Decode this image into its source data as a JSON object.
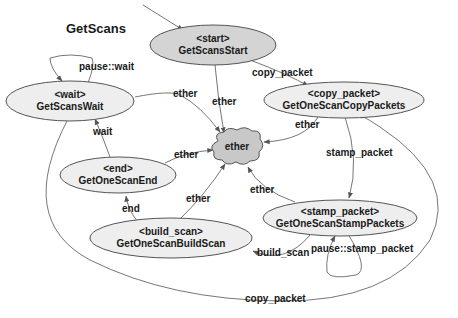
{
  "title": "GetScans",
  "colors": {
    "node_fill": "#eeeeee",
    "start_fill": "#d4d4d4",
    "ether_fill": "#c8c8c8",
    "stroke": "#555555"
  },
  "nodes": [
    {
      "id": "start",
      "stereotype": "<start>",
      "name": "GetScansStart"
    },
    {
      "id": "wait",
      "stereotype": "<wait>",
      "name": "GetScansWait"
    },
    {
      "id": "copy_packet",
      "stereotype": "<copy_packet>",
      "name": "GetOneScanCopyPackets"
    },
    {
      "id": "end",
      "stereotype": "<end>",
      "name": "GetOneScanEnd"
    },
    {
      "id": "stamp_packet",
      "stereotype": "<stamp_packet>",
      "name": "GetOneScanStampPackets"
    },
    {
      "id": "build_scan",
      "stereotype": "<build_scan>",
      "name": "GetOneScanBuildScan"
    },
    {
      "id": "ether",
      "name": "ether"
    }
  ],
  "edges": [
    {
      "label": "copy_packet",
      "from": "GetScansStart",
      "to": "GetOneScanCopyPackets"
    },
    {
      "label": "ether",
      "from": "GetScansStart",
      "to": "ether"
    },
    {
      "label": "pause::wait",
      "from": "GetScansWait",
      "to": "GetScansWait"
    },
    {
      "label": "ether",
      "from": "GetScansWait",
      "to": "ether"
    },
    {
      "label": "ether",
      "from": "GetOneScanCopyPackets",
      "to": "ether"
    },
    {
      "label": "stamp_packet",
      "from": "GetOneScanCopyPackets",
      "to": "GetOneScanStampPackets"
    },
    {
      "label": "wait",
      "from": "GetOneScanEnd",
      "to": "GetScansWait"
    },
    {
      "label": "ether",
      "from": "GetOneScanEnd",
      "to": "ether"
    },
    {
      "label": "ether",
      "from": "GetOneScanStampPackets",
      "to": "ether"
    },
    {
      "label": "end",
      "from": "GetOneScanBuildScan",
      "to": "GetOneScanEnd"
    },
    {
      "label": "ether",
      "from": "GetOneScanBuildScan",
      "to": "ether"
    },
    {
      "label": "build_scan",
      "from": "GetOneScanStampPackets",
      "to": "GetOneScanBuildScan"
    },
    {
      "label": "pause::stamp_packet",
      "from": "GetOneScanStampPackets",
      "to": "GetOneScanStampPackets"
    },
    {
      "label": "copy_packet",
      "from": "GetScansWait",
      "to": "GetOneScanCopyPackets"
    }
  ]
}
